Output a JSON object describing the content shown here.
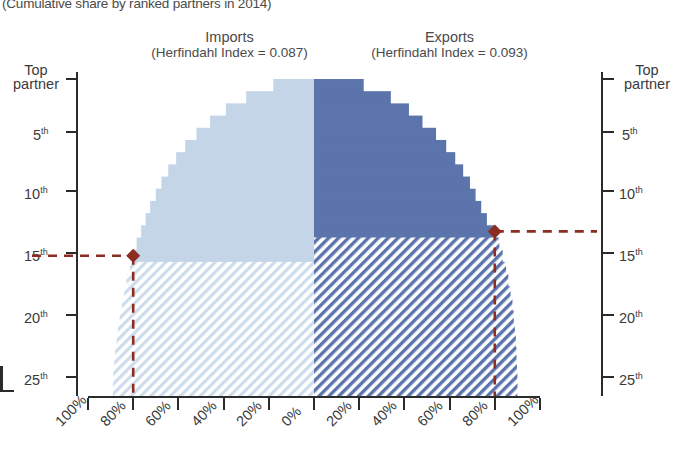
{
  "subtitle": "(Cumulative share by ranked partners in 2014)",
  "panels": {
    "left": {
      "title": "Imports",
      "index_label": "(Herfindahl Index = 0.087)"
    },
    "right": {
      "title": "Exports",
      "index_label": "(Herfindahl Index = 0.093)"
    }
  },
  "axes": {
    "y_left_labels": [
      "Top partner",
      "5th",
      "10th",
      "15th",
      "20th",
      "25th"
    ],
    "y_right_labels": [
      "Top partner",
      "5th",
      "10th",
      "15th",
      "20th",
      "25th"
    ],
    "y_left_top_line1": "Top",
    "y_left_top_line2": "partner",
    "x_labels": [
      "100%",
      "80%",
      "60%",
      "40%",
      "20%",
      "0%",
      "20%",
      "40%",
      "60%",
      "80%",
      "100%"
    ]
  },
  "colors": {
    "imports_solid": "#c5d5e8",
    "imports_hatch": "#cfdceb",
    "exports_solid": "#5b74ac",
    "exports_hatch": "#5b74ac",
    "marker": "#8b2d20",
    "axis": "#2b2b2b",
    "text": "#3a3a3a"
  },
  "markers": {
    "imports": {
      "rank": 15,
      "share": "80%",
      "label": "15th / 80%"
    },
    "exports": {
      "rank": 13,
      "share": "80%",
      "label": "13th / 80%"
    }
  },
  "chart_data": {
    "type": "area",
    "title": "",
    "subtitle": "(Cumulative share by ranked partners in 2014)",
    "xlabel": "",
    "ylabel": "Partner rank",
    "orientation": "horizontal-diverging",
    "xlim": [
      -100,
      100
    ],
    "ylim": [
      1,
      26
    ],
    "grid": false,
    "legend": "none",
    "x_tick_values": [
      -100,
      -80,
      -60,
      -40,
      -20,
      0,
      20,
      40,
      60,
      80,
      100
    ],
    "x_tick_labels": [
      "100%",
      "80%",
      "60%",
      "40%",
      "20%",
      "0%",
      "20%",
      "40%",
      "60%",
      "80%",
      "100%"
    ],
    "y_tick_values": [
      1,
      5,
      10,
      15,
      20,
      25
    ],
    "y_tick_labels": [
      "Top partner",
      "5th",
      "10th",
      "15th",
      "20th",
      "25th"
    ],
    "ranks": [
      1,
      2,
      3,
      4,
      5,
      6,
      7,
      8,
      9,
      10,
      11,
      12,
      13,
      14,
      15,
      16,
      17,
      18,
      19,
      20,
      21,
      22,
      23,
      24,
      25,
      26
    ],
    "series": [
      {
        "name": "Imports",
        "side": "left",
        "herfindahl_index": 0.087,
        "fill": "solid-above-rank-15, hatched-below",
        "cumulative_share_pct": [
          18,
          30,
          39,
          46,
          52,
          57,
          61,
          64.5,
          67.5,
          70,
          72.5,
          74.5,
          76.5,
          78.5,
          80,
          81.5,
          83,
          84,
          85,
          86,
          86.8,
          87.4,
          88,
          88.4,
          88.8,
          89
        ]
      },
      {
        "name": "Exports",
        "side": "right",
        "herfindahl_index": 0.093,
        "fill": "solid-above-rank-13, hatched-below",
        "cumulative_share_pct": [
          22,
          34,
          42,
          48,
          54,
          58.5,
          62.5,
          66,
          69,
          71.5,
          74,
          76.5,
          80,
          82,
          83.5,
          85,
          86,
          87,
          87.8,
          88.4,
          88.9,
          89.3,
          89.6,
          89.8,
          90,
          90
        ]
      }
    ],
    "annotations": [
      {
        "series": "Imports",
        "rank": 15,
        "value_pct": 80,
        "marker": "diamond",
        "color": "#8b2d20"
      },
      {
        "series": "Exports",
        "rank": 13,
        "value_pct": 80,
        "marker": "diamond",
        "color": "#8b2d20"
      }
    ]
  }
}
